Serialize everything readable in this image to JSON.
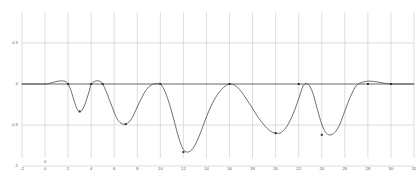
{
  "chart_data": {
    "type": "line",
    "title": "",
    "subtitle": "",
    "xlabel": "",
    "ylabel": "",
    "xlim": [
      -2,
      32
    ],
    "ylim": [
      -1.15,
      0.72
    ],
    "grid": true,
    "legend": false,
    "legend_position": "none",
    "line_color": "#4a4a4a",
    "grid_color": "#c8c8c8",
    "axis_color": "#555555",
    "marker": "point",
    "xticks": [
      -2,
      0,
      2,
      4,
      6,
      8,
      10,
      12,
      14,
      16,
      18,
      20,
      22,
      24,
      26,
      28,
      30,
      32
    ],
    "xtick_labels": [
      "-2",
      "0",
      "2",
      "4",
      "6",
      "8",
      "10",
      "12",
      "14",
      "16",
      "18",
      "20",
      "22",
      "24",
      "26",
      "28",
      "30",
      "32"
    ],
    "yticks": [
      0.5,
      0,
      -0.5,
      -1
    ],
    "ytick_labels": [
      "0.5",
      "0",
      "-0.5",
      "-1"
    ],
    "origin_marker_label": "0",
    "series": [
      {
        "name": "signal",
        "color": "#4a4a4a",
        "x": [
          -2.0,
          -1.5,
          -1.0,
          -0.5,
          0.0,
          0.3,
          0.6,
          0.9,
          1.2,
          1.5,
          1.8,
          2.0,
          2.2,
          2.4,
          2.6,
          2.8,
          3.0,
          3.2,
          3.4,
          3.6,
          3.8,
          4.0,
          4.2,
          4.5,
          4.8,
          5.0,
          5.3,
          5.6,
          5.9,
          6.2,
          6.5,
          6.8,
          7.0,
          7.3,
          7.6,
          7.9,
          8.2,
          8.6,
          9.0,
          9.4,
          9.7,
          10.0,
          10.4,
          10.8,
          11.2,
          11.6,
          12.0,
          12.4,
          12.8,
          13.2,
          13.6,
          14.0,
          14.5,
          15.0,
          15.5,
          16.0,
          16.5,
          17.0,
          17.5,
          18.0,
          18.5,
          19.0,
          19.5,
          20.0,
          20.5,
          21.0,
          21.5,
          22.0,
          22.4,
          22.8,
          23.2,
          23.6,
          24.0,
          24.4,
          24.8,
          25.2,
          25.6,
          26.0,
          26.5,
          27.0,
          27.5,
          28.0,
          28.6,
          29.2,
          29.6,
          30.0,
          30.5,
          31.0,
          31.5,
          32.0
        ],
        "y": [
          0.0,
          0.0,
          0.0,
          0.0,
          0.0,
          0.005,
          0.015,
          0.028,
          0.036,
          0.038,
          0.03,
          0.0,
          -0.06,
          -0.15,
          -0.24,
          -0.31,
          -0.335,
          -0.32,
          -0.27,
          -0.19,
          -0.1,
          0.0,
          0.025,
          0.04,
          0.03,
          0.0,
          -0.09,
          -0.2,
          -0.31,
          -0.41,
          -0.47,
          -0.49,
          -0.49,
          -0.46,
          -0.4,
          -0.31,
          -0.22,
          -0.11,
          -0.035,
          -0.002,
          0.005,
          0.0,
          -0.09,
          -0.25,
          -0.45,
          -0.66,
          -0.8,
          -0.83,
          -0.79,
          -0.69,
          -0.55,
          -0.4,
          -0.24,
          -0.12,
          -0.04,
          0.0,
          -0.02,
          -0.09,
          -0.19,
          -0.3,
          -0.41,
          -0.5,
          -0.57,
          -0.6,
          -0.59,
          -0.51,
          -0.37,
          -0.18,
          -0.02,
          0.0,
          -0.1,
          -0.3,
          -0.49,
          -0.6,
          -0.62,
          -0.58,
          -0.48,
          -0.33,
          -0.15,
          -0.02,
          0.02,
          0.035,
          0.03,
          0.015,
          0.005,
          0.0,
          0.0,
          0.0,
          0.0,
          0.0
        ],
        "markers": [
          {
            "x": 2.0,
            "y": 0.0
          },
          {
            "x": 3.0,
            "y": -0.335
          },
          {
            "x": 4.0,
            "y": 0.0
          },
          {
            "x": 5.0,
            "y": 0.0
          },
          {
            "x": 7.0,
            "y": -0.49
          },
          {
            "x": 10.0,
            "y": 0.0
          },
          {
            "x": 12.0,
            "y": -0.83
          },
          {
            "x": 16.0,
            "y": 0.0
          },
          {
            "x": 20.0,
            "y": -0.6
          },
          {
            "x": 22.0,
            "y": 0.0
          },
          {
            "x": 24.0,
            "y": -0.62
          },
          {
            "x": 28.0,
            "y": 0.0
          },
          {
            "x": 30.0,
            "y": 0.0
          }
        ]
      }
    ]
  }
}
